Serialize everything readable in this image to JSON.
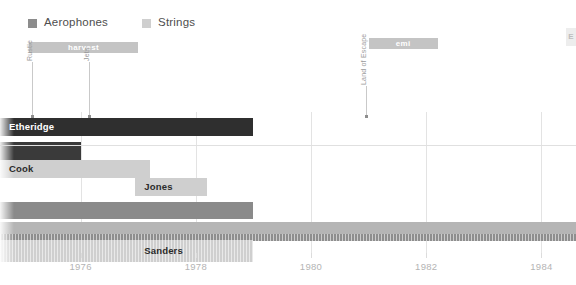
{
  "chart_data": {
    "type": "bar",
    "title": "",
    "xlabel": "",
    "ylabel": "",
    "orientation": "horizontal",
    "xlim": [
      1974.6,
      1984.6
    ],
    "grid": true,
    "legend_position": "top-left",
    "tick_labels": [
      "1976",
      "1978",
      "1980",
      "1982",
      "1984"
    ],
    "tick_values": [
      1976,
      1978,
      1980,
      1982,
      1984
    ],
    "legend": [
      {
        "label": "Aerophones",
        "color": "#8c8c8c"
      },
      {
        "label": "Strings",
        "color": "#cfcfcf"
      }
    ],
    "bands": [
      {
        "label": "harvest",
        "start": 1975.1,
        "end": 1977.0,
        "color": "#c4c4c4"
      },
      {
        "label": "emi",
        "start": 1981.0,
        "end": 1982.2,
        "color": "#c4c4c4"
      }
    ],
    "annotations": [
      {
        "label": "Rustle",
        "x": 1975.15
      },
      {
        "label": "Jets",
        "x": 1976.15
      },
      {
        "label": "Land of Escape",
        "x": 1980.95
      }
    ],
    "bars": [
      {
        "label": "Etheridge",
        "series": "Aerophones",
        "start": 1974.6,
        "end": 1979.0,
        "color": "#2f2f2f",
        "label_color": "light"
      },
      {
        "label": "",
        "series": "Aerophones",
        "start": 1974.6,
        "end": 1976.0,
        "color": "#3a3a3a",
        "label_color": "light"
      },
      {
        "label": "Cook",
        "series": "Strings",
        "start": 1974.6,
        "end": 1977.2,
        "color": "#cfcfcf",
        "label_color": "dark"
      },
      {
        "label": "Jones",
        "series": "Strings",
        "start": 1976.95,
        "end": 1978.2,
        "color": "#cfcfcf",
        "label_color": "dark"
      },
      {
        "label": "",
        "series": "Aerophones",
        "start": 1974.6,
        "end": 1979.0,
        "color": "#8a8a8a",
        "label_color": "light"
      },
      {
        "label": "",
        "series": "Strings",
        "start": 1974.6,
        "end": 1984.6,
        "color": "#b5b5b5",
        "label_color": "dark"
      },
      {
        "label": "",
        "series": "Aerophones",
        "start": 1974.6,
        "end": 1984.6,
        "color": "#8e8e8e",
        "label_color": "light",
        "hatched": true
      },
      {
        "label": "Sanders",
        "series": "Strings",
        "start": 1974.6,
        "end": 1979.0,
        "color": "#cfcfcf",
        "label_color": "dark",
        "hatched": true
      }
    ]
  },
  "edge_marker": {
    "text": "E"
  }
}
